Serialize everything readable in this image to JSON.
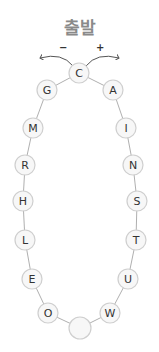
{
  "title": "출발",
  "direction": {
    "minus": "−",
    "plus": "+"
  },
  "colors": {
    "node_fill": "#f7f7f7",
    "node_stroke": "#cfcfcf",
    "line": "#9a9a9a",
    "text": "#333333",
    "title": "#8a8a8a"
  },
  "nodes": [
    {
      "label": "C",
      "x": 79,
      "y": 73
    },
    {
      "label": "A",
      "x": 113,
      "y": 90
    },
    {
      "label": "I",
      "x": 126,
      "y": 128
    },
    {
      "label": "N",
      "x": 133,
      "y": 165
    },
    {
      "label": "S",
      "x": 137,
      "y": 201
    },
    {
      "label": "T",
      "x": 136,
      "y": 240
    },
    {
      "label": "U",
      "x": 128,
      "y": 279
    },
    {
      "label": "W",
      "x": 110,
      "y": 313
    },
    {
      "label": "",
      "x": 80,
      "y": 328
    },
    {
      "label": "O",
      "x": 48,
      "y": 313
    },
    {
      "label": "E",
      "x": 32,
      "y": 279
    },
    {
      "label": "L",
      "x": 25,
      "y": 240
    },
    {
      "label": "H",
      "x": 23,
      "y": 201
    },
    {
      "label": "R",
      "x": 25,
      "y": 165
    },
    {
      "label": "M",
      "x": 33,
      "y": 128
    },
    {
      "label": "G",
      "x": 47,
      "y": 90
    }
  ]
}
